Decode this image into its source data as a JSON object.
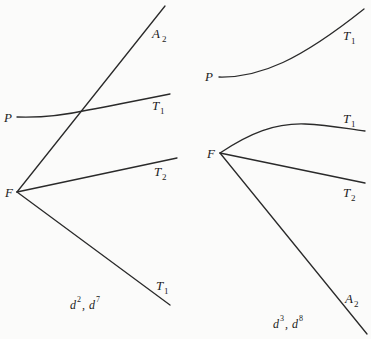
{
  "diagrams": [
    {
      "caption": {
        "base1": "d",
        "exp1": "2",
        "sep": ", ",
        "base2": "d",
        "exp2": "7"
      },
      "labels": {
        "P": {
          "text": "P"
        },
        "F": {
          "text": "F"
        },
        "A2": {
          "text": "A",
          "sub": "2"
        },
        "T1_upper": {
          "text": "T",
          "sub": "1"
        },
        "T2": {
          "text": "T",
          "sub": "2"
        },
        "T1_lower": {
          "text": "T",
          "sub": "1"
        }
      },
      "curves": [
        {
          "name": "P-T1",
          "from": "P",
          "to": "T1",
          "shape": "slightly-rising curve"
        },
        {
          "name": "F-A2",
          "from": "F",
          "to": "A2",
          "shape": "straight, steep rising"
        },
        {
          "name": "F-T2",
          "from": "F",
          "to": "T2",
          "shape": "straight, gently rising"
        },
        {
          "name": "F-T1",
          "from": "F",
          "to": "T1",
          "shape": "straight, descending"
        }
      ]
    },
    {
      "caption": {
        "base1": "d",
        "exp1": "3",
        "sep": ", ",
        "base2": "d",
        "exp2": "8"
      },
      "labels": {
        "P": {
          "text": "P"
        },
        "F": {
          "text": "F"
        },
        "T1_top": {
          "text": "T",
          "sub": "1"
        },
        "T1_mid": {
          "text": "T",
          "sub": "1"
        },
        "T2": {
          "text": "T",
          "sub": "2"
        },
        "A2": {
          "text": "A",
          "sub": "2"
        }
      },
      "curves": [
        {
          "name": "P-T1",
          "from": "P",
          "to": "T1",
          "shape": "curving upward"
        },
        {
          "name": "F-T1",
          "from": "F",
          "to": "T1",
          "shape": "arched curve"
        },
        {
          "name": "F-T2",
          "from": "F",
          "to": "T2",
          "shape": "straight, gently descending"
        },
        {
          "name": "F-A2",
          "from": "F",
          "to": "A2",
          "shape": "straight, steep descending"
        }
      ]
    }
  ]
}
